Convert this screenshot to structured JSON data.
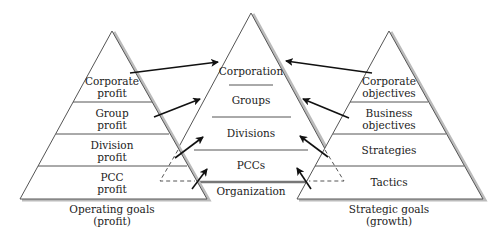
{
  "diagram": {
    "left_pyramid": {
      "caption_line1": "Operating goals",
      "caption_line2": "(profit)",
      "levels": [
        {
          "line1": "Corporate",
          "line2": "profit"
        },
        {
          "line1": "Group",
          "line2": "profit"
        },
        {
          "line1": "Division",
          "line2": "profit"
        },
        {
          "line1": "PCC",
          "line2": "profit"
        }
      ]
    },
    "center_pyramid": {
      "caption": "Organization",
      "levels": [
        {
          "label": "Corporation"
        },
        {
          "label": "Groups"
        },
        {
          "label": "Divisions"
        },
        {
          "label": "PCCs"
        }
      ]
    },
    "right_pyramid": {
      "caption_line1": "Strategic goals",
      "caption_line2": "(growth)",
      "levels": [
        {
          "line1": "Corporate",
          "line2": "objectives"
        },
        {
          "line1": "Business",
          "line2": "objectives"
        },
        {
          "line1": "Strategies",
          "line2": ""
        },
        {
          "line1": "Tactics",
          "line2": ""
        }
      ]
    },
    "arrows": [
      {
        "from": "Corporate profit",
        "to": "Corporation"
      },
      {
        "from": "Group profit",
        "to": "Groups"
      },
      {
        "from": "Division profit",
        "to": "Divisions"
      },
      {
        "from": "PCC profit",
        "to": "PCCs"
      },
      {
        "from": "Corporate objectives",
        "to": "Corporation"
      },
      {
        "from": "Business objectives",
        "to": "Groups"
      },
      {
        "from": "Strategies",
        "to": "Divisions"
      },
      {
        "from": "Tactics",
        "to": "PCCs"
      }
    ]
  }
}
